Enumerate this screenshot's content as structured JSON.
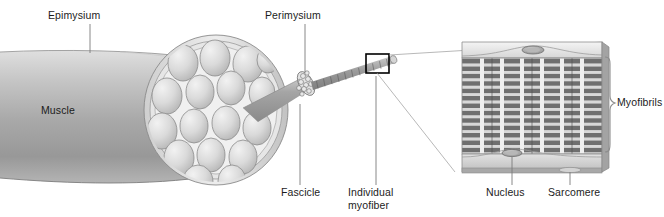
{
  "figure": {
    "colors": {
      "muscle_light": "#dcdcdc",
      "muscle_mid": "#aaaaaa",
      "muscle_dark": "#8d8d8d",
      "fascicle_fill": "#d3d3d3",
      "outline": "#4a4a4a",
      "leader": "#6f6f6f",
      "text": "#1c1c1c",
      "band_dark": "#6e6e6e",
      "band_light": "#c4c4c4",
      "panel_face": "#bdbdbd",
      "callout_box": "#000000"
    }
  },
  "labels": {
    "epimysium": "Epimysium",
    "perimysium": "Perimysium",
    "muscle": "Muscle",
    "fascicle": "Fascicle",
    "myofiber_line1": "Individual",
    "myofiber_line2": "myofiber",
    "nucleus": "Nucleus",
    "sarcomere": "Sarcomere",
    "myofibrils": "Myofibrils"
  },
  "structures": {
    "fascicle_count_visible": 17,
    "myofiber_bundle_count": 19,
    "myofibril_columns": 7,
    "sarcomere_rows": 13,
    "nuclei_visible": 3
  }
}
